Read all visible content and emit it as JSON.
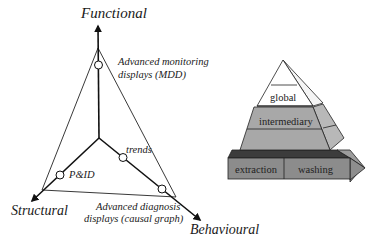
{
  "diagram": {
    "axes": {
      "functional": "Functional",
      "structural": "Structural",
      "behavioural": "Behavioural"
    },
    "points": {
      "mdd_line1": "Advanced monitoring",
      "mdd_line2": "displays (MDD)",
      "trends": "trends",
      "pid": "P&ID",
      "causal_line1": "Advanced diagnosis",
      "causal_line2": "displays (causal graph)"
    }
  },
  "pyramid": {
    "top": "global",
    "middle": "intermediary",
    "bottom_left": "extraction",
    "bottom_right": "washing",
    "colors": {
      "top": "#ffffff",
      "middle": "#a8a8a8",
      "middle_side": "#b8b8b8",
      "bottom": "#8c8c8c",
      "bottom_top": "#3c3c3c",
      "bottom_side": "#9c9c9c"
    }
  }
}
